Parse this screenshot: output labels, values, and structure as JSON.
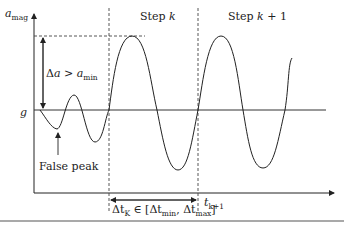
{
  "diagram": {
    "y_axis_label": {
      "main": "a",
      "sub": "mag"
    },
    "x_axis_end_label": {
      "main": "t",
      "sub": "k+1"
    },
    "baseline_label": "g",
    "step_labels": [
      {
        "prefix": "Step ",
        "var": "k",
        "suffix": ""
      },
      {
        "prefix": "Step ",
        "var": "k",
        "suffix": " + 1"
      }
    ],
    "delta_a_label": {
      "lhs_delta": "Δ",
      "lhs_var": "a",
      "op": " > ",
      "rhs_var": "a",
      "rhs_sub": "min"
    },
    "false_peak_label": "False peak",
    "delta_t_label": {
      "lhs": "Δt",
      "lhs_sub": "K",
      "in": " ∈ [",
      "min": "Δt",
      "min_sub": "min",
      "comma": ", ",
      "max": "Δt",
      "max_sub": "max",
      "close": "]"
    },
    "colors": {
      "line": "#222222",
      "dashed": "#444444",
      "rule": "#555555"
    }
  }
}
